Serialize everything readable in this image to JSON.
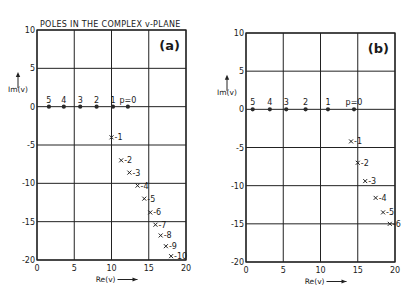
{
  "figure": {
    "title": "POLES IN THE COMPLEX v-PLANE"
  },
  "chart_data": [
    {
      "type": "scatter",
      "panel_label": "(a)",
      "title": "POLES IN THE COMPLEX v-PLANE",
      "xlabel": "Re(v)",
      "ylabel": "Im(v)",
      "xlim": [
        0,
        20
      ],
      "ylim": [
        -20,
        10
      ],
      "xticks": [
        0,
        5,
        10,
        15,
        20
      ],
      "yticks": [
        10,
        5,
        0,
        -5,
        -10,
        -15,
        -20
      ],
      "grid": true,
      "frame": {
        "left": 37,
        "right": 186,
        "top": 30,
        "bottom": 260
      },
      "series": [
        {
          "name": "real-axis poles",
          "marker": "dot",
          "points": [
            {
              "label": "5",
              "re": 1.6,
              "im": 0
            },
            {
              "label": "4",
              "re": 3.6,
              "im": 0
            },
            {
              "label": "3",
              "re": 5.8,
              "im": 0
            },
            {
              "label": "2",
              "re": 8.0,
              "im": 0
            },
            {
              "label": "1",
              "re": 10.2,
              "im": 0
            },
            {
              "label": "p=0",
              "re": 12.2,
              "im": 0
            }
          ]
        },
        {
          "name": "complex poles",
          "marker": "cross",
          "points": [
            {
              "label": "-1",
              "re": 10.0,
              "im": -4.0
            },
            {
              "label": "-2",
              "re": 11.3,
              "im": -7.0
            },
            {
              "label": "-3",
              "re": 12.4,
              "im": -8.6
            },
            {
              "label": "-4",
              "re": 13.5,
              "im": -10.3
            },
            {
              "label": "-5",
              "re": 14.4,
              "im": -12.0
            },
            {
              "label": "-6",
              "re": 15.2,
              "im": -13.8
            },
            {
              "label": "-7",
              "re": 15.9,
              "im": -15.4
            },
            {
              "label": "-8",
              "re": 16.6,
              "im": -16.8
            },
            {
              "label": "-9",
              "re": 17.3,
              "im": -18.2
            },
            {
              "label": "-10",
              "re": 18.0,
              "im": -19.5
            }
          ]
        }
      ]
    },
    {
      "type": "scatter",
      "panel_label": "(b)",
      "title": "",
      "xlabel": "Re(v)",
      "ylabel": "Im(v)",
      "xlim": [
        0,
        20
      ],
      "ylim": [
        -20,
        10
      ],
      "xticks": [
        0,
        5,
        10,
        15,
        20
      ],
      "yticks": [
        10,
        5,
        0,
        -5,
        -10,
        -15,
        -20
      ],
      "grid": true,
      "frame": {
        "left": 246,
        "right": 395,
        "top": 33,
        "bottom": 262
      },
      "series": [
        {
          "name": "real-axis poles",
          "marker": "dot",
          "points": [
            {
              "label": "5",
              "re": 0.9,
              "im": 0
            },
            {
              "label": "4",
              "re": 3.2,
              "im": 0
            },
            {
              "label": "3",
              "re": 5.4,
              "im": 0
            },
            {
              "label": "2",
              "re": 8.0,
              "im": 0
            },
            {
              "label": "1",
              "re": 11.0,
              "im": 0
            },
            {
              "label": "p=0",
              "re": 14.5,
              "im": 0
            }
          ]
        },
        {
          "name": "complex poles",
          "marker": "cross",
          "points": [
            {
              "label": "-1",
              "re": 14.1,
              "im": -4.2
            },
            {
              "label": "-2",
              "re": 15.0,
              "im": -7.0
            },
            {
              "label": "-3",
              "re": 16.0,
              "im": -9.4
            },
            {
              "label": "-4",
              "re": 17.4,
              "im": -11.6
            },
            {
              "label": "-5",
              "re": 18.4,
              "im": -13.5
            },
            {
              "label": "-6",
              "re": 19.3,
              "im": -15.0
            }
          ]
        }
      ]
    }
  ]
}
